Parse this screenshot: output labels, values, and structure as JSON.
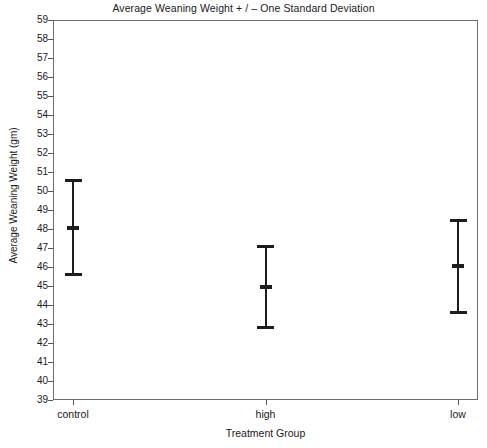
{
  "chart_data": {
    "type": "scatter",
    "title": "Average Weaning Weight + / – One Standard Deviation",
    "xlabel": "Treatment Group",
    "ylabel": "Average Weaning Weight (gm)",
    "categories": [
      "control",
      "high",
      "low"
    ],
    "values": [
      48.1,
      45.0,
      46.1
    ],
    "error_low": [
      45.6,
      42.8,
      43.6
    ],
    "error_high": [
      50.7,
      47.2,
      48.6
    ],
    "errors": [
      2.5,
      2.2,
      2.5
    ],
    "ylim": [
      39,
      59
    ],
    "yticks": [
      39,
      40,
      41,
      42,
      43,
      44,
      45,
      46,
      47,
      48,
      49,
      50,
      51,
      52,
      53,
      54,
      55,
      56,
      57,
      58,
      59
    ],
    "ytick_labels": [
      "39",
      "40",
      "41",
      "42",
      "43",
      "44",
      "45",
      "46",
      "47",
      "48",
      "49",
      "50",
      "51",
      "52",
      "53",
      "54",
      "55",
      "56",
      "57",
      "58",
      "59"
    ],
    "grid": false,
    "legend": false,
    "legend_position": "none",
    "series": [
      {
        "name": "Average Weaning Weight",
        "points": [
          {
            "category": "control",
            "mean": 48.1,
            "sd": 2.5,
            "lower": 45.6,
            "upper": 50.7
          },
          {
            "category": "high",
            "mean": 45.0,
            "sd": 2.2,
            "lower": 42.8,
            "upper": 47.2
          },
          {
            "category": "low",
            "mean": 46.1,
            "sd": 2.5,
            "lower": 43.6,
            "upper": 48.6
          }
        ]
      }
    ],
    "marker_color": "#1d1d1d",
    "axis_color": "#6e6e6e",
    "background_color": "#ffffff"
  }
}
